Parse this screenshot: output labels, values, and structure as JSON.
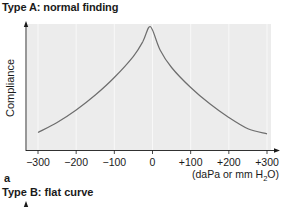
{
  "figure": {
    "title_a": "Type A: normal finding",
    "panel_label": "a",
    "title_b": "Type B: flat curve"
  },
  "colors": {
    "plot_background": "#ececec",
    "curve": "#6e6e6e",
    "axis": "#1a1a1a",
    "gridline": "#f8f8f8"
  },
  "chart_data": {
    "type": "line",
    "title": "Type A: normal finding",
    "xlabel": "(daPa or mm H2O)",
    "xlabel_parts": {
      "pre": "(daPa or mm H",
      "sub": "2",
      "post": "O)"
    },
    "ylabel": "Compliance",
    "x_ticks": [
      "−300",
      "−200",
      "−100",
      "0",
      "+100",
      "+200",
      "+300"
    ],
    "x_tick_values": [
      -300,
      -200,
      -100,
      0,
      100,
      200,
      300
    ],
    "xlim": [
      -300,
      300
    ],
    "ylim": [
      0,
      100
    ],
    "y_ticks": [],
    "grid": "vertical",
    "legend": null,
    "series": [
      {
        "name": "Compliance (Type A)",
        "x": [
          -300,
          -250,
          -200,
          -150,
          -100,
          -50,
          -25,
          -10,
          0,
          20,
          50,
          100,
          150,
          200,
          250,
          300
        ],
        "values": [
          14,
          22,
          32,
          44,
          58,
          75,
          87,
          98,
          96,
          80,
          66,
          50,
          37,
          26,
          17,
          13
        ]
      }
    ]
  }
}
